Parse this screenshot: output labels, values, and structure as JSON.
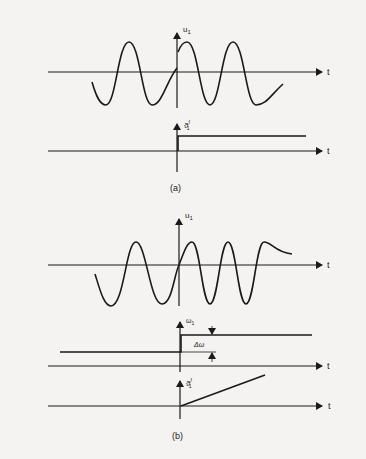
{
  "figure": {
    "panel_a": {
      "caption": "(a)",
      "top_plot": {
        "y_label": "u",
        "y_label_sub": "1",
        "x_label": "t",
        "signal": "sinusoid with phase jump at t=0",
        "periods_shown": 3
      },
      "bottom_plot": {
        "y_label": "ϑ",
        "y_label_sup": "f",
        "y_label_sub": "1",
        "x_label": "t",
        "signal": "step at t=0"
      }
    },
    "panel_b": {
      "caption": "(b)",
      "top_plot": {
        "y_label": "u",
        "y_label_sub": "1",
        "x_label": "t",
        "signal": "sinusoid with frequency step at t=0",
        "periods_shown": 3.5
      },
      "middle_plot": {
        "y_label": "ω",
        "y_label_sub": "1",
        "x_label": "t",
        "delta_label": "Δω",
        "signal": "frequency step at t=0"
      },
      "bottom_plot": {
        "y_label": "ϑ",
        "y_label_sup": "f",
        "y_label_sub": "1",
        "x_label": "t",
        "signal": "phase ramp starting at t=0"
      }
    },
    "colors": {
      "ink": "#1a1a1a",
      "paper": "#f4f3f1"
    }
  }
}
